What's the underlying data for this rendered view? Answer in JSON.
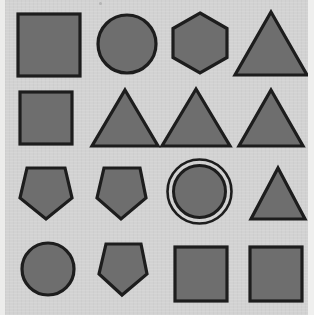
{
  "image": {
    "title": "Geometric shape grid",
    "width": 314,
    "height": 315,
    "background_color": "#d2d2d2",
    "shape_fill_color": "#6e6e6e",
    "shape_stroke_color": "#1d1d1d",
    "rows": 4,
    "columns": 4,
    "total_shapes": 16
  },
  "grid": {
    "rows": [
      {
        "row_index": 1,
        "cells": [
          {
            "shape": "square",
            "label": "square",
            "column": 1
          },
          {
            "shape": "circle",
            "label": "circle",
            "column": 2
          },
          {
            "shape": "hexagon",
            "label": "hexagon",
            "column": 3
          },
          {
            "shape": "triangle",
            "label": "triangle",
            "column": 4
          }
        ]
      },
      {
        "row_index": 2,
        "cells": [
          {
            "shape": "square",
            "label": "square",
            "column": 1
          },
          {
            "shape": "triangle",
            "label": "triangle",
            "column": 2
          },
          {
            "shape": "triangle",
            "label": "triangle",
            "column": 3
          },
          {
            "shape": "triangle",
            "label": "triangle",
            "column": 4
          }
        ]
      },
      {
        "row_index": 3,
        "cells": [
          {
            "shape": "pentagon",
            "label": "pentagon",
            "column": 1
          },
          {
            "shape": "pentagon",
            "label": "pentagon",
            "column": 2
          },
          {
            "shape": "ringcircle",
            "label": "circle with outer ring",
            "column": 3
          },
          {
            "shape": "triangle",
            "label": "triangle",
            "column": 4
          }
        ]
      },
      {
        "row_index": 4,
        "cells": [
          {
            "shape": "circle",
            "label": "circle",
            "column": 1
          },
          {
            "shape": "pentagon",
            "label": "pentagon",
            "column": 2
          },
          {
            "shape": "square",
            "label": "square",
            "column": 3
          },
          {
            "shape": "square",
            "label": "square",
            "column": 4
          }
        ]
      }
    ]
  }
}
